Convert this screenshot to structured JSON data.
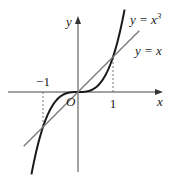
{
  "chart_data": {
    "type": "line",
    "title": "",
    "xlabel": "x",
    "ylabel": "y",
    "origin_label": "O",
    "xlim": [
      -2.1,
      1.9
    ],
    "ylim": [
      -2.45,
      2.4
    ],
    "grid": false,
    "x_ticks": [
      {
        "value": -1,
        "label": "−1"
      },
      {
        "value": 1,
        "label": "1"
      }
    ],
    "series": [
      {
        "name": "y = x³",
        "label_main": "y = x",
        "label_sup": "3",
        "function": "x^3",
        "domain": [
          -1.33,
          1.33
        ],
        "color": "#1a1a1a"
      },
      {
        "name": "y = x",
        "label_main": "y = x",
        "label_sup": "",
        "function": "x",
        "domain": [
          -1.55,
          1.75
        ],
        "color": "#7a7a7a"
      }
    ],
    "intersections": [
      [
        -1,
        -1
      ],
      [
        0,
        0
      ],
      [
        1,
        1
      ]
    ]
  }
}
